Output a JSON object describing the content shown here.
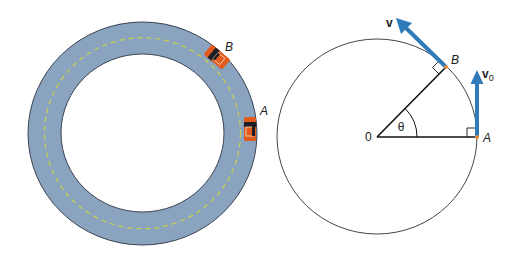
{
  "colors": {
    "background": "#ffffff",
    "road": "#8aa4bf",
    "road_edge": "#3a4350",
    "center_line": "#c8d24a",
    "car_body": "#e25a1c",
    "car_glass": "#1e1e24",
    "car_inner": "#f2e6c8",
    "vector": "#2f7ab8",
    "circle_line": "#444444",
    "point": "#e0893a"
  },
  "track": {
    "label_car_a": "A",
    "label_car_b": "B"
  },
  "geometry": {
    "center_label": "0",
    "angle_label": "θ",
    "point_a_label": "A",
    "point_b_label": "B",
    "velocity_label": "v",
    "initial_velocity_label": "v",
    "initial_velocity_subscript": "0"
  }
}
